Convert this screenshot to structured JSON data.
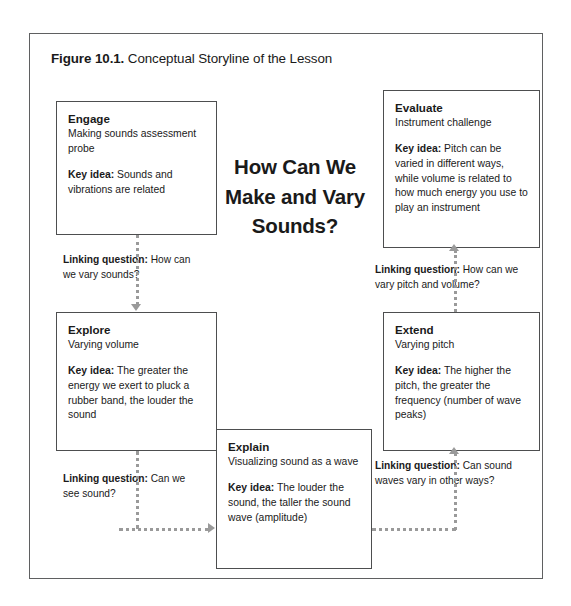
{
  "figure": {
    "label": "Figure 10.1.",
    "caption": " Conceptual Storyline of the Lesson"
  },
  "center_question": "How Can We Make and Vary Sounds?",
  "key_idea_label": "Key idea:",
  "linking_label": "Linking question:",
  "nodes": {
    "engage": {
      "title": "Engage",
      "subtitle": "Making sounds assessment probe",
      "key_idea": " Sounds and vibrations are related"
    },
    "evaluate": {
      "title": "Evaluate",
      "subtitle": "Instrument challenge",
      "key_idea": " Pitch can be varied in different ways, while volume is related to how much energy you use to play an instrument"
    },
    "explore": {
      "title": "Explore",
      "subtitle": "Varying volume",
      "key_idea": " The greater the energy we exert to pluck a rubber band, the louder the sound"
    },
    "extend": {
      "title": "Extend",
      "subtitle": "Varying pitch",
      "key_idea": " The higher the pitch, the greater the frequency (number of wave peaks)"
    },
    "explain": {
      "title": "Explain",
      "subtitle": "Visualizing sound as a wave",
      "key_idea": " The louder the sound, the taller the sound wave (amplitude)"
    }
  },
  "links": {
    "engage_to_explore": " How can we vary sounds?",
    "extend_to_evaluate": " How can we vary pitch and volume?",
    "explore_to_explain": " Can we see sound?",
    "explain_to_extend": " Can sound waves vary in other ways?"
  },
  "colors": {
    "frame_border": "#5f6061",
    "box_border": "#4d4e4f",
    "connector": "#9a9a9a",
    "text": "#1a1a1a",
    "background": "#ffffff"
  }
}
